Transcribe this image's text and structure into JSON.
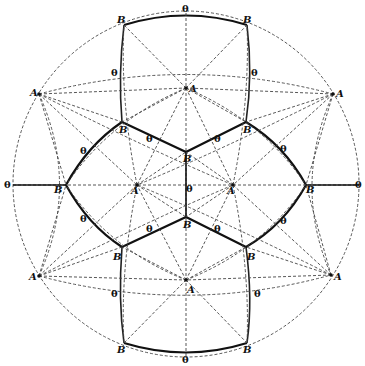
{
  "diagram": {
    "type": "stereographic-projection",
    "colors": {
      "line": "#222222",
      "background": "#ffffff"
    },
    "labels": {
      "theta": "θ",
      "A": "A",
      "B": "B"
    },
    "outer_circle": {
      "cx": 186,
      "cy": 184,
      "r": 173
    },
    "theta_outer": [
      {
        "id": "theta-top",
        "text": "θ",
        "x": 182,
        "y": 12
      },
      {
        "id": "theta-bottom",
        "text": "θ",
        "x": 182,
        "y": 363
      },
      {
        "id": "theta-left",
        "text": "θ",
        "x": 4,
        "y": 188
      },
      {
        "id": "theta-right",
        "text": "θ",
        "x": 355,
        "y": 188
      }
    ],
    "points_A_outer": [
      {
        "text": "A",
        "x": 39,
        "y": 94
      },
      {
        "text": "A",
        "x": 333,
        "y": 94
      },
      {
        "text": "A",
        "x": 39,
        "y": 276
      },
      {
        "text": "A",
        "x": 331,
        "y": 275
      }
    ],
    "points_A_inner": [
      {
        "text": "A",
        "x": 186,
        "y": 88
      },
      {
        "text": "A",
        "x": 186,
        "y": 280
      },
      {
        "text": "A",
        "x": 137,
        "y": 185
      },
      {
        "text": "A",
        "x": 233,
        "y": 185
      }
    ],
    "points_B_rim": [
      {
        "text": "B",
        "x": 124,
        "y": 25
      },
      {
        "text": "B",
        "x": 246,
        "y": 25
      },
      {
        "text": "B",
        "x": 124,
        "y": 343
      },
      {
        "text": "B",
        "x": 246,
        "y": 343
      }
    ],
    "points_B_inner": [
      {
        "text": "B",
        "x": 122,
        "y": 122
      },
      {
        "text": "B",
        "x": 246,
        "y": 122
      },
      {
        "text": "B",
        "x": 122,
        "y": 247
      },
      {
        "text": "B",
        "x": 246,
        "y": 247
      },
      {
        "text": "B",
        "x": 186,
        "y": 152
      },
      {
        "text": "B",
        "x": 186,
        "y": 217
      },
      {
        "text": "B",
        "x": 66,
        "y": 185
      },
      {
        "text": "B",
        "x": 302,
        "y": 185
      }
    ],
    "theta_inner": [
      {
        "text": "θ",
        "x": 111,
        "y": 76
      },
      {
        "text": "θ",
        "x": 251,
        "y": 76
      },
      {
        "text": "θ",
        "x": 80,
        "y": 154
      },
      {
        "text": "θ",
        "x": 146,
        "y": 142
      },
      {
        "text": "θ",
        "x": 214,
        "y": 142
      },
      {
        "text": "θ",
        "x": 280,
        "y": 152
      },
      {
        "text": "θ",
        "x": 186,
        "y": 192
      },
      {
        "text": "θ",
        "x": 80,
        "y": 222
      },
      {
        "text": "θ",
        "x": 146,
        "y": 232
      },
      {
        "text": "θ",
        "x": 214,
        "y": 232
      },
      {
        "text": "θ",
        "x": 280,
        "y": 224
      },
      {
        "text": "θ",
        "x": 111,
        "y": 297
      },
      {
        "text": "θ",
        "x": 254,
        "y": 297
      }
    ]
  }
}
